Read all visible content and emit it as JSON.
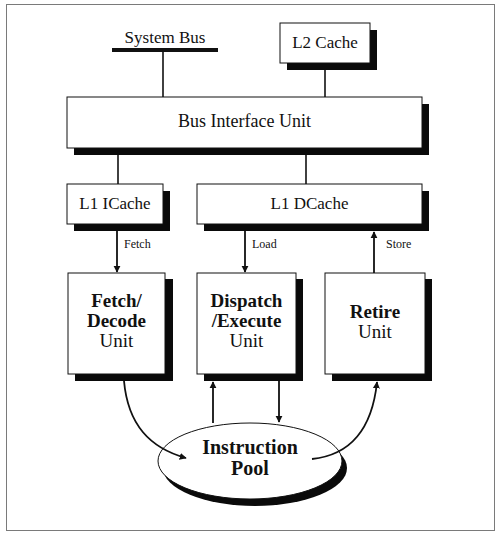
{
  "diagram": {
    "type": "block-diagram",
    "title": "",
    "nodes": [
      {
        "id": "system_bus",
        "label": "System Bus",
        "shape": "bus-bar"
      },
      {
        "id": "l2_cache",
        "label": "L2 Cache",
        "shape": "box-shadow"
      },
      {
        "id": "biu",
        "label": "Bus Interface Unit",
        "shape": "box-shadow"
      },
      {
        "id": "l1_icache",
        "label": "L1 ICache",
        "shape": "box-shadow"
      },
      {
        "id": "l1_dcache",
        "label": "L1 DCache",
        "shape": "box-shadow"
      },
      {
        "id": "fetch_decode",
        "label_bold": [
          "Fetch/",
          "Decode"
        ],
        "label_plain": "Unit",
        "shape": "box-shadow"
      },
      {
        "id": "dispatch_execute",
        "label_bold": [
          "Dispatch",
          "/Execute"
        ],
        "label_plain": "Unit",
        "shape": "box-shadow"
      },
      {
        "id": "retire",
        "label_bold": [
          "Retire"
        ],
        "label_plain": "Unit",
        "shape": "box-shadow"
      },
      {
        "id": "instruction_pool",
        "label_bold": [
          "Instruction",
          "Pool"
        ],
        "shape": "ellipse-shadow"
      }
    ],
    "edges": [
      {
        "from": "system_bus",
        "to": "biu",
        "label": "",
        "arrow": "none"
      },
      {
        "from": "l2_cache",
        "to": "biu",
        "label": "",
        "arrow": "none"
      },
      {
        "from": "biu",
        "to": "l1_icache",
        "label": "",
        "arrow": "none"
      },
      {
        "from": "biu",
        "to": "l1_dcache",
        "label": "",
        "arrow": "none"
      },
      {
        "from": "l1_icache",
        "to": "fetch_decode",
        "label": "Fetch",
        "arrow": "forward"
      },
      {
        "from": "l1_dcache",
        "to": "dispatch_execute",
        "label": "Load",
        "arrow": "forward"
      },
      {
        "from": "retire",
        "to": "l1_dcache",
        "label": "Store",
        "arrow": "forward"
      },
      {
        "from": "fetch_decode",
        "to": "instruction_pool",
        "label": "",
        "arrow": "forward",
        "curved": true
      },
      {
        "from": "instruction_pool",
        "to": "dispatch_execute",
        "label": "",
        "arrow": "forward"
      },
      {
        "from": "dispatch_execute",
        "to": "instruction_pool",
        "label": "",
        "arrow": "forward"
      },
      {
        "from": "instruction_pool",
        "to": "retire",
        "label": "",
        "arrow": "forward",
        "curved": true
      }
    ]
  },
  "labels": {
    "system_bus": "System Bus",
    "l2_cache": "L2 Cache",
    "biu": "Bus Interface Unit",
    "l1_icache": "L1 ICache",
    "l1_dcache": "L1 DCache",
    "fetch": "Fetch",
    "load": "Load",
    "store": "Store",
    "fetch_decode": {
      "line1": "Fetch/",
      "line2": "Decode",
      "line3": "Unit"
    },
    "dispatch_execute": {
      "line1": "Dispatch",
      "line2": "/Execute",
      "line3": "Unit"
    },
    "retire": {
      "line1": "Retire",
      "line2": "Unit"
    },
    "instruction_pool": {
      "line1": "Instruction",
      "line2": "Pool"
    }
  },
  "colors": {
    "stroke": "#111111",
    "shadow": "#0a0a0a",
    "fill": "#ffffff",
    "frame": "#7a7a7a"
  }
}
